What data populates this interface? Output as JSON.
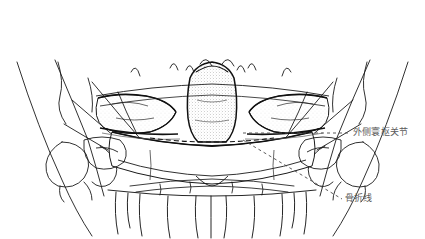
{
  "figure": {
    "view_title": "",
    "background_color": "#ffffff",
    "ink_color": "#1a1a1a",
    "label_color": "#5a5a5a",
    "leader_color": "#4a4a4a"
  },
  "annotations": [
    {
      "id": "lateral-atlantoaxial-joint",
      "text": "外侧寰枢关节",
      "leader": "horizontal-dashed",
      "target_x": 243,
      "target_y": 133
    },
    {
      "id": "fracture-line",
      "text": "骨折线",
      "leader": "diagonal-dashed",
      "target_x": 243,
      "target_y": 140
    }
  ]
}
